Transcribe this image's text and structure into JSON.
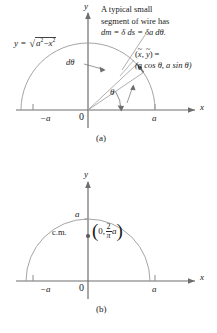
{
  "figure": {
    "panels": [
      {
        "id": "a",
        "caption": "(a)",
        "axes": {
          "x_label": "x",
          "y_label": "y",
          "origin_label": "0",
          "tick_right_label": "a",
          "tick_left_label": "−a"
        },
        "curve_equation": {
          "lhs": "y =",
          "radicand_first": "a",
          "radicand_exp_first": "2",
          "radicand_minus": "−",
          "radicand_second": "x",
          "radicand_exp_second": "2"
        },
        "annotation_note": {
          "line1": "A typical small",
          "line2": "segment of wire has",
          "line3": "dm = δ ds = δa dθ."
        },
        "point_label": {
          "line1_lhs": "(",
          "line1_x": "x",
          "line1_comma": ", ",
          "line1_y": "y",
          "line1_rhs": ") =",
          "line2": "(a cos θ, a sin θ)"
        },
        "dtheta_label": "dθ",
        "theta_label": "θ"
      },
      {
        "id": "b",
        "caption": "(b)",
        "axes": {
          "x_label": "x",
          "y_label": "y",
          "origin_label": "0",
          "tick_right_label": "a",
          "tick_left_label": "−a",
          "tick_y_label": "a"
        },
        "cm_label": "c.m.",
        "cm_coordinate": {
          "open_paren": "(",
          "x_value": "0,",
          "frac_numerator": "2",
          "frac_denominator": "π",
          "multiplier": "a",
          "close_paren": ")"
        }
      }
    ]
  },
  "colors": {
    "ink": "#1a1a1a",
    "curve": "#8c8c8c",
    "axis": "#6e6e6e",
    "leader": "#9a9a9a",
    "point_dot": "#5a5a5a"
  }
}
